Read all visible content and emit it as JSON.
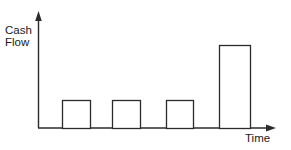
{
  "figure": {
    "background_color": "#ffffff",
    "line_color": "#2b2b2b",
    "bar_fill_color": "#ffffff",
    "text_color": "#1a1a1a",
    "width": 291,
    "height": 150
  },
  "labels": {
    "y_axis_line1": "Cash",
    "y_axis_line2": "Flow",
    "x_axis": "Time"
  },
  "chart_data": {
    "type": "bar",
    "title": "",
    "xlabel": "Time",
    "ylabel": "Cash Flow",
    "categories": [
      "1",
      "2",
      "3",
      "4"
    ],
    "values": [
      28,
      28,
      28,
      83
    ],
    "value_unit": "px",
    "ylim": [
      0,
      116
    ],
    "xlim": [
      0,
      237
    ],
    "grid": false,
    "legend": false,
    "axis_style": "arrowed-open",
    "bar_style": "outline-unfilled",
    "bars": [
      {
        "index": 1,
        "x_left": 62,
        "x_right": 90,
        "width": 28,
        "top_y": 100,
        "height": 28,
        "label": ""
      },
      {
        "index": 2,
        "x_left": 112,
        "x_right": 140,
        "width": 28,
        "top_y": 100,
        "height": 28,
        "label": ""
      },
      {
        "index": 3,
        "x_left": 166,
        "x_right": 193,
        "width": 27,
        "top_y": 100,
        "height": 28,
        "label": ""
      },
      {
        "index": 4,
        "x_left": 219,
        "x_right": 250,
        "width": 31,
        "top_y": 45,
        "height": 83,
        "label": ""
      }
    ],
    "axes": {
      "baseline_y": 128,
      "origin_x": 38,
      "y_axis_top": 12,
      "x_axis_right": 275
    },
    "annotations": []
  }
}
